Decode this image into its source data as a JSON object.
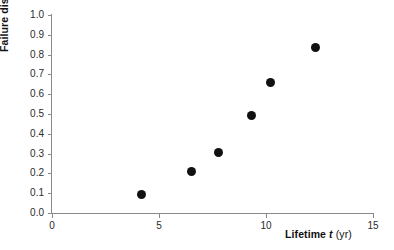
{
  "chart_data": {
    "type": "scatter",
    "title": "",
    "xlabel": "Lifetime t (yr)",
    "ylabel": "Failure distribution F",
    "xlim": [
      0,
      15
    ],
    "ylim": [
      0.0,
      1.0
    ],
    "grid": false,
    "legend": null,
    "xticks": [
      "0",
      "5",
      "10",
      "15"
    ],
    "xtick_values": [
      0,
      5,
      10,
      15
    ],
    "yticks": [
      "0.0",
      "0.1",
      "0.2",
      "0.3",
      "0.4",
      "0.5",
      "0.6",
      "0.7",
      "0.8",
      "0.9",
      "1.0"
    ],
    "ytick_values": [
      0.0,
      0.1,
      0.2,
      0.3,
      0.4,
      0.5,
      0.6,
      0.7,
      0.8,
      0.9,
      1.0
    ],
    "marker": "filled-circle",
    "marker_color": "#111111",
    "axis_color": "#8a8a8a",
    "points": [
      {
        "x": 4.2,
        "y": 0.095
      },
      {
        "x": 6.5,
        "y": 0.21
      },
      {
        "x": 7.8,
        "y": 0.305
      },
      {
        "x": 9.3,
        "y": 0.49
      },
      {
        "x": 10.2,
        "y": 0.66
      },
      {
        "x": 12.3,
        "y": 0.835
      }
    ],
    "series": [
      {
        "name": "Failure distribution",
        "x": [
          4.2,
          6.5,
          7.8,
          9.3,
          10.2,
          12.3
        ],
        "values": [
          0.095,
          0.21,
          0.305,
          0.49,
          0.66,
          0.835
        ]
      }
    ]
  },
  "axis_titles": {
    "y_main": "Failure distribution",
    "y_symbol": "F",
    "x_main": "Lifetime",
    "x_symbol": "t",
    "x_unit": "(yr)"
  }
}
